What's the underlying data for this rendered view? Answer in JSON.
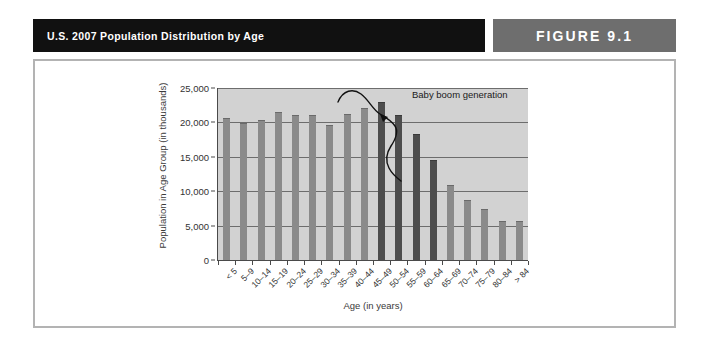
{
  "header": {
    "title": "U.S. 2007 Population Distribution by Age",
    "figure_label": "FIGURE 9.1",
    "band_color": "#111111",
    "badge_color": "#6e6e6e",
    "text_color": "#ffffff"
  },
  "figure": {
    "frame_border_color": "#b3b3b3"
  },
  "chart_data": {
    "type": "bar",
    "title": "U.S. 2007 Population Distribution by Age",
    "xlabel": "Age (in years)",
    "ylabel": "Population in Age Group (in thousands)",
    "categories": [
      "< 5",
      "5–9",
      "10–14",
      "15–19",
      "20–24",
      "25–29",
      "30–34",
      "35–39",
      "40–44",
      "45–49",
      "50–54",
      "55–59",
      "60–64",
      "65–69",
      "70–74",
      "75–79",
      "80–84",
      "> 84"
    ],
    "values": [
      20700,
      19900,
      20300,
      21500,
      21100,
      21100,
      19600,
      21200,
      22100,
      22900,
      21100,
      18300,
      14500,
      10900,
      8700,
      7400,
      5700,
      5600
    ],
    "highlighted": [
      false,
      false,
      false,
      false,
      false,
      false,
      false,
      false,
      false,
      true,
      true,
      true,
      true,
      false,
      false,
      false,
      false,
      false
    ],
    "ylim": [
      0,
      25000
    ],
    "ytick_labels": [
      "25,000",
      "20,000",
      "15,000",
      "10,000",
      "5,000",
      "0"
    ],
    "ytick_values": [
      25000,
      20000,
      15000,
      10000,
      5000,
      0
    ],
    "grid": true,
    "legend": "none",
    "plot_background": "#d2d2d2",
    "bar_color": "#8a8a8a",
    "highlight_bar_color": "#4d4d4d",
    "annotations": [
      {
        "text": "Baby boom generation",
        "target": "45–49 through 60–64"
      }
    ]
  }
}
